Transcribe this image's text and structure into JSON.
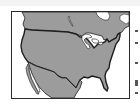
{
  "map": {
    "title": "",
    "subject": "Contiguous United States with neighboring Canada and Mexico",
    "colors": {
      "land": "#9c9c9c",
      "water": "#ffffff",
      "outline": "#1e1e1e",
      "frame": "#2a2a2a"
    },
    "regions": [
      {
        "name": "United States",
        "highlighted": true
      },
      {
        "name": "Canada",
        "highlighted": false
      },
      {
        "name": "Mexico",
        "highlighted": false
      }
    ],
    "features": [
      "Great Lakes",
      "Baja California",
      "Gulf of Mexico",
      "Florida peninsula",
      "Hudson Bay"
    ]
  },
  "side_marks": {
    "count": 5
  }
}
